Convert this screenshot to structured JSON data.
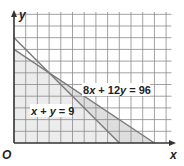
{
  "chart_data": {
    "type": "line",
    "title": "",
    "xlabel": "x",
    "ylabel": "y",
    "origin_label": "O",
    "xlim": [
      0,
      13.8
    ],
    "ylim": [
      0,
      11
    ],
    "grid": true,
    "grid_step": 1,
    "legend": null,
    "series": [
      {
        "name": "x + y = 9",
        "label": "x + y = 9",
        "points": [
          [
            0,
            9
          ],
          [
            9,
            0
          ]
        ],
        "x_intercept": 9,
        "y_intercept": 9
      },
      {
        "name": "8x + 12y = 96",
        "label": "8x + 12y = 96",
        "points": [
          [
            0,
            8
          ],
          [
            12,
            0
          ]
        ],
        "x_intercept": 12,
        "y_intercept": 8
      }
    ],
    "intersection": [
      3,
      6
    ],
    "shaded_regions": [
      {
        "description": "feasible region below both lines",
        "vertices": [
          [
            0,
            0
          ],
          [
            0,
            8
          ],
          [
            3,
            6
          ],
          [
            9,
            0
          ]
        ],
        "color": "#ececec"
      },
      {
        "description": "region between lines right of intersection",
        "vertices": [
          [
            3,
            6
          ],
          [
            12,
            0
          ],
          [
            9,
            0
          ]
        ],
        "color": "#dedede"
      }
    ],
    "annotations": [
      {
        "text": "8x + 12y = 96",
        "position": [
          5.8,
          5.0
        ]
      },
      {
        "text": "x + y = 9",
        "position": [
          1.5,
          3.1
        ]
      }
    ]
  },
  "labels": {
    "x_axis": "x",
    "y_axis": "y",
    "origin": "O",
    "eq1_parts": [
      "x",
      " + ",
      "y",
      " = 9"
    ],
    "eq2_parts": [
      "8",
      "x",
      " + 12",
      "y",
      " = 96"
    ]
  },
  "colors": {
    "grid": "#8a8a8a",
    "axis": "#333333",
    "line": "#7a7a7a",
    "shade_light": "#ececec",
    "shade_dark": "#dedede",
    "text": "#222222"
  }
}
